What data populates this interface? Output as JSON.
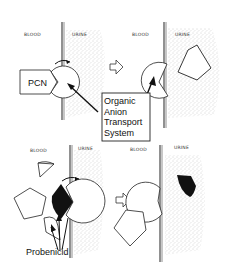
{
  "figure": {
    "panels": [
      {
        "id": "top-left",
        "blood_label": "BLOOD",
        "urine_label": "URINE",
        "substrate_label": "PCN"
      },
      {
        "id": "top-right",
        "blood_label": "BLOOD",
        "urine_label": "URINE"
      },
      {
        "id": "bottom-left",
        "blood_label": "BLOOD",
        "urine_label": "URINE"
      },
      {
        "id": "bottom-right",
        "blood_label": "BLOOD",
        "urine_label": "URINE"
      }
    ],
    "callout_transport": {
      "lines": [
        "Organic",
        "Anion",
        "Transport",
        "System"
      ]
    },
    "callout_inhibitor": {
      "label": "Probenicid"
    },
    "colors": {
      "ink": "#111111",
      "stipple": "#9a9a9a",
      "background": "#ffffff",
      "inhibitor_fill": "#111111"
    }
  }
}
